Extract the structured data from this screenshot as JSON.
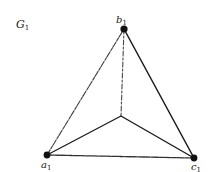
{
  "title": "G",
  "title_sub": "1",
  "vertices": [
    {
      "id": "b1",
      "base": "b",
      "sub": "1"
    },
    {
      "id": "a1",
      "base": "a",
      "sub": "1"
    },
    {
      "id": "c1",
      "base": "c",
      "sub": "1"
    }
  ],
  "edges": [
    [
      "a1",
      "b1"
    ],
    [
      "b1",
      "c1"
    ],
    [
      "a1",
      "c1"
    ],
    [
      "b1",
      "center"
    ],
    [
      "a1",
      "center"
    ],
    [
      "c1",
      "center"
    ]
  ],
  "colors": {
    "stroke": "#1a1a1a",
    "background": "#ffffff"
  }
}
